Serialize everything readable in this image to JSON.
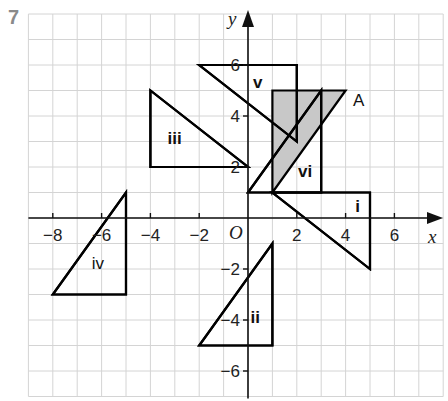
{
  "question_number": "7",
  "axes": {
    "x_label": "x",
    "y_label": "y",
    "origin_label": "O",
    "x_ticks": [
      {
        "value": -8,
        "label": "−8"
      },
      {
        "value": -6,
        "label": "−6"
      },
      {
        "value": -4,
        "label": "−4"
      },
      {
        "value": -2,
        "label": "−2"
      },
      {
        "value": 2,
        "label": "2"
      },
      {
        "value": 4,
        "label": "4"
      },
      {
        "value": 6,
        "label": "6"
      }
    ],
    "y_ticks": [
      {
        "value": 6,
        "label": "6"
      },
      {
        "value": 4,
        "label": "4"
      },
      {
        "value": 2,
        "label": "2"
      },
      {
        "value": -2,
        "label": "−2"
      },
      {
        "value": -4,
        "label": "−4"
      },
      {
        "value": -6,
        "label": "−6"
      }
    ],
    "x_range": [
      -9,
      8
    ],
    "y_range": [
      -7,
      8
    ]
  },
  "shapes": [
    {
      "id": "A",
      "label": "A",
      "shaded": true,
      "vertices": [
        [
          1,
          1
        ],
        [
          1,
          5
        ],
        [
          4,
          5
        ]
      ],
      "label_pos": [
        4.3,
        4.4
      ]
    },
    {
      "id": "i",
      "label": "i",
      "shaded": false,
      "vertices": [
        [
          1,
          1
        ],
        [
          5,
          1
        ],
        [
          5,
          -2
        ]
      ],
      "label_pos": [
        4.4,
        0.25
      ]
    },
    {
      "id": "ii",
      "label": "ii",
      "shaded": false,
      "vertices": [
        [
          1,
          -1
        ],
        [
          1,
          -5
        ],
        [
          -2,
          -5
        ]
      ],
      "label_pos": [
        0.1,
        -4.1
      ]
    },
    {
      "id": "iii",
      "label": "iii",
      "shaded": false,
      "vertices": [
        [
          -4,
          5
        ],
        [
          -4,
          2
        ],
        [
          0,
          2
        ]
      ],
      "label_pos": [
        -3.3,
        2.9
      ]
    },
    {
      "id": "iv",
      "label": "iv",
      "shaded": false,
      "vertices": [
        [
          -5,
          1
        ],
        [
          -5,
          -3
        ],
        [
          -8,
          -3
        ]
      ],
      "label_pos": [
        -6.4,
        -2.0
      ]
    },
    {
      "id": "v",
      "label": "v",
      "shaded": false,
      "vertices": [
        [
          -2,
          6
        ],
        [
          2,
          6
        ],
        [
          2,
          3
        ]
      ],
      "label_pos": [
        0.2,
        5.1
      ]
    },
    {
      "id": "vi",
      "label": "vi",
      "shaded": false,
      "vertices": [
        [
          0,
          1
        ],
        [
          3,
          5
        ],
        [
          3,
          1
        ]
      ],
      "label_pos": [
        2.05,
        1.6
      ]
    }
  ],
  "colors": {
    "grid": "#d4d4d4",
    "shape_stroke": "#000000",
    "shade_fill": "#c8c8c8",
    "question_number": "#8a8a8a"
  }
}
